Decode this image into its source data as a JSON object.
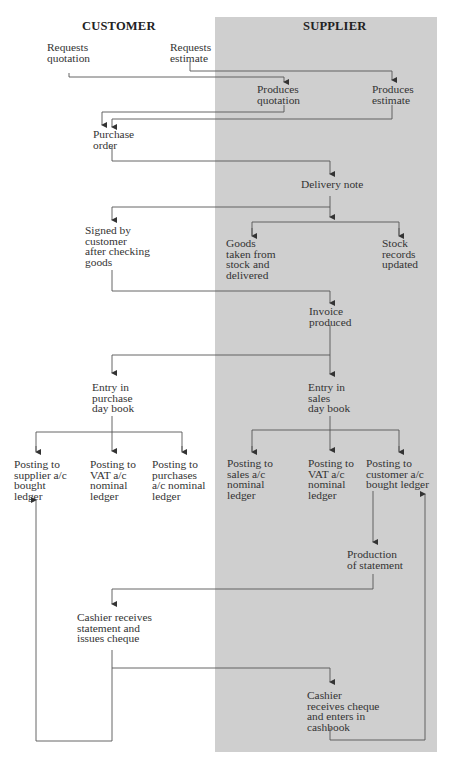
{
  "columns": {
    "customer": "CUSTOMER",
    "supplier": "SUPPLIER"
  },
  "colors": {
    "supplier_shade": "#cfcfcf",
    "line": "#444444",
    "text": "#333333"
  },
  "nodes": {
    "requests_quotation": "Requests\nquotation",
    "requests_estimate": "Requests\nestimate",
    "produces_quotation": "Produces\nquotation",
    "produces_estimate": "Produces\nestimate",
    "purchase_order": "Purchase\norder",
    "delivery_note": "Delivery note",
    "signed_by_customer": "Signed by\ncustomer\nafter checking\ngoods",
    "goods_taken": "Goods\ntaken from\nstock and\ndelivered",
    "stock_records": "Stock\nrecords\nupdated",
    "invoice_produced": "Invoice\nproduced",
    "entry_purchase_day_book": "Entry in\npurchase\nday book",
    "entry_sales_day_book": "Entry in\nsales\nday book",
    "posting_supplier": "Posting to\nsupplier a/c\nbought\nledger",
    "posting_vat_customer": "Posting to\nVAT a/c\nnominal\nledger",
    "posting_purchases": "Posting to\npurchases\na/c nominal\nledger",
    "posting_sales": "Posting to\nsales a/c\nnominal\nledger",
    "posting_vat_supplier": "Posting to\nVAT a/c\nnominal\nledger",
    "posting_customer": "Posting to\ncustomer a/c\nbought ledger",
    "production_of_statement": "Production\nof statement",
    "cashier_issues_cheque": "Cashier receives\nstatement and\nissues cheque",
    "cashier_receives_cheque": "Cashier\nreceives cheque\nand enters in\ncashbook"
  }
}
